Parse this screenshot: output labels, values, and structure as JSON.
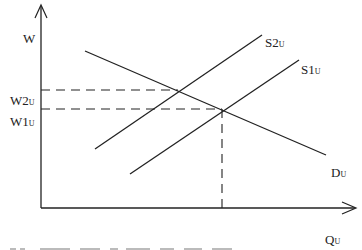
{
  "diagram": {
    "type": "supply-demand",
    "y_axis_label": "W",
    "x_axis_label": {
      "main": "Q",
      "sub": "U"
    },
    "price_levels": [
      {
        "name": "W2",
        "main": "W2",
        "sub": "U"
      },
      {
        "name": "W1",
        "main": "W1",
        "sub": "U"
      }
    ],
    "curves": [
      {
        "id": "D",
        "main": "D",
        "sub": "U",
        "kind": "demand"
      },
      {
        "id": "S2",
        "main": "S2",
        "sub": "U",
        "kind": "supply"
      },
      {
        "id": "S1",
        "main": "S1",
        "sub": "U",
        "kind": "supply"
      }
    ],
    "line_color": "#222222",
    "footer_fragment": "..."
  }
}
